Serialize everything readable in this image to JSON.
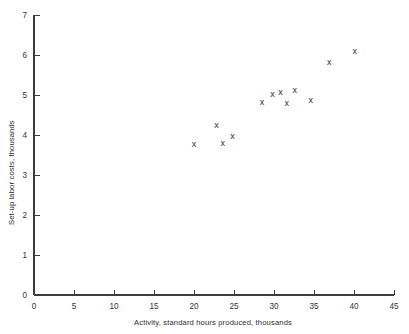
{
  "chart_data": {
    "type": "scatter",
    "title": "",
    "xlabel": "Activity, standard hours produced, thousands",
    "ylabel": "Set-up labor costs, thousands",
    "xlim": [
      0,
      45
    ],
    "ylim": [
      0,
      7
    ],
    "grid": false,
    "legend": null,
    "marker_glyph": "x",
    "xticks": [
      0,
      5,
      10,
      15,
      20,
      25,
      30,
      35,
      40,
      45
    ],
    "xtick_labels": [
      "0",
      "5",
      "10",
      "15",
      "20",
      "25",
      "30",
      "35",
      "40",
      "45"
    ],
    "yticks": [
      0,
      1,
      2,
      3,
      4,
      5,
      6,
      7
    ],
    "ytick_labels": [
      "0",
      "1",
      "2",
      "3",
      "4",
      "5",
      "6",
      "7"
    ],
    "points": [
      {
        "x": 20.0,
        "y": 3.78
      },
      {
        "x": 22.8,
        "y": 4.25
      },
      {
        "x": 23.6,
        "y": 3.8
      },
      {
        "x": 24.8,
        "y": 3.98
      },
      {
        "x": 28.5,
        "y": 4.82
      },
      {
        "x": 29.8,
        "y": 5.03
      },
      {
        "x": 30.8,
        "y": 5.08
      },
      {
        "x": 31.6,
        "y": 4.8
      },
      {
        "x": 32.6,
        "y": 5.13
      },
      {
        "x": 34.6,
        "y": 4.88
      },
      {
        "x": 36.9,
        "y": 5.82
      },
      {
        "x": 40.1,
        "y": 6.1
      }
    ]
  },
  "colors": {
    "axis": "#3b3b3b",
    "text": "#2b2b2b",
    "marker": "#2f2f2f",
    "background": "#ffffff"
  }
}
